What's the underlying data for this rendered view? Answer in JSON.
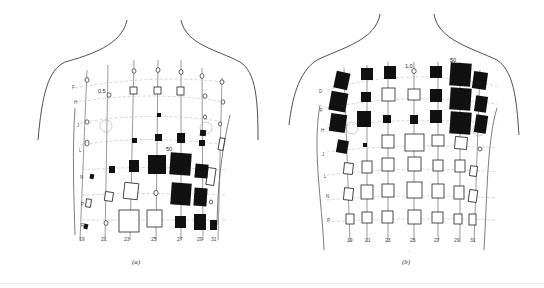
{
  "figure": {
    "panels": [
      {
        "id": "a",
        "caption": "(a)",
        "value_label": "50",
        "scale_label": "0.5",
        "column_labels": [
          "19",
          "21",
          "23",
          "25",
          "27",
          "29",
          "31"
        ],
        "row_labels": [
          "F",
          "H",
          "J",
          "L",
          "N",
          "P",
          "R"
        ]
      },
      {
        "id": "b",
        "caption": "(b)",
        "value_label": "50",
        "scale_label": "1.0",
        "column_labels": [
          "19",
          "21",
          "23",
          "25",
          "27",
          "29",
          "31"
        ],
        "row_labels": [
          "D",
          "F",
          "H",
          "J",
          "L",
          "N",
          "P"
        ]
      }
    ],
    "colors": {
      "ink": "#111111",
      "paper": "#ffffff",
      "grid": "#999999"
    }
  }
}
